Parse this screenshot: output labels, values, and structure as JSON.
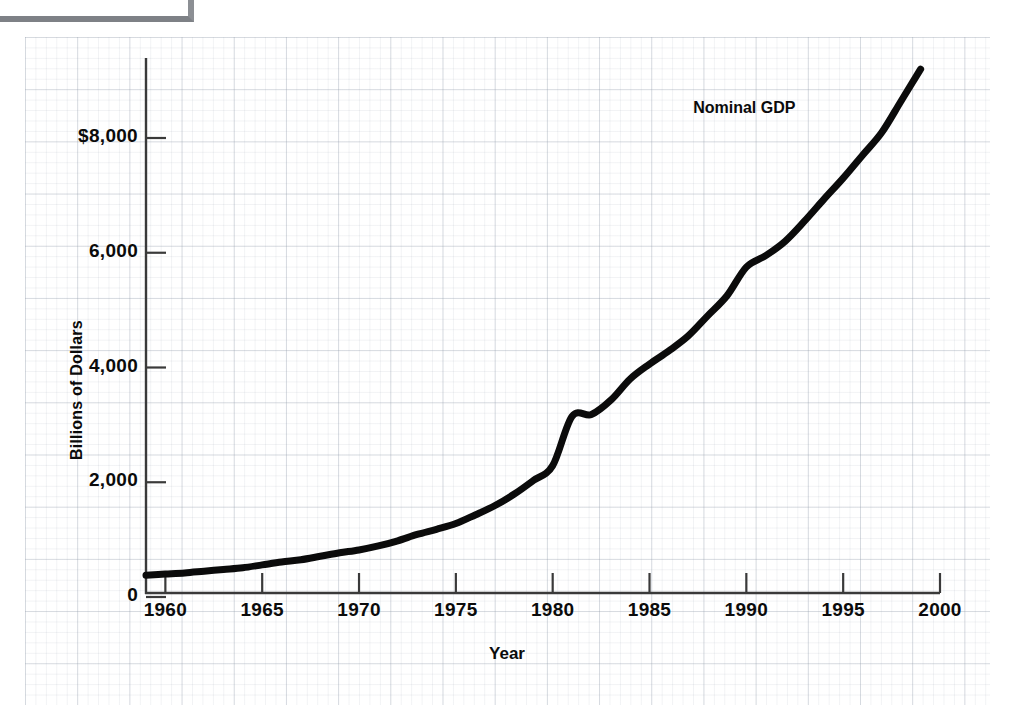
{
  "figure": {
    "background_color": "#ffffff",
    "grid_color": "#96a0af",
    "ink_color": "#0b0b0b"
  },
  "chart_data": {
    "type": "line",
    "title": "",
    "xlabel": "Year",
    "ylabel": "Billions of Dollars",
    "xlim": [
      1959,
      2000
    ],
    "ylim": [
      0,
      9600
    ],
    "xticks": [
      1960,
      1965,
      1970,
      1975,
      1980,
      1985,
      1990,
      1995,
      2000
    ],
    "xtick_labels": [
      "1960",
      "1965",
      "1970",
      "1975",
      "1980",
      "1985",
      "1990",
      "1995",
      "2000"
    ],
    "yticks": [
      0,
      2000,
      4000,
      6000,
      8000
    ],
    "ytick_labels": [
      "0",
      "2,000",
      "4,000",
      "6,000",
      "$8,000"
    ],
    "grid": true,
    "legend_position": "inline-annotation",
    "series": [
      {
        "name": "Nominal GDP",
        "annotation": "Nominal GDP",
        "annotation_at": [
          1995.0,
          8500
        ],
        "color": "#0b0b0b",
        "line_width": 7,
        "x": [
          1959,
          1960,
          1961,
          1962,
          1963,
          1964,
          1965,
          1966,
          1967,
          1968,
          1969,
          1970,
          1971,
          1972,
          1973,
          1974,
          1975,
          1976,
          1977,
          1978,
          1979,
          1980,
          1981,
          1982,
          1983,
          1984,
          1985,
          1986,
          1987,
          1988,
          1989,
          1990,
          1991,
          1992,
          1993,
          1994,
          1995,
          1996,
          1997,
          1998,
          1999
        ],
        "values": [
          380,
          400,
          420,
          450,
          480,
          510,
          560,
          610,
          650,
          710,
          770,
          820,
          890,
          980,
          1090,
          1180,
          1280,
          1430,
          1590,
          1790,
          2030,
          2290,
          3150,
          3180,
          3430,
          3800,
          4060,
          4290,
          4550,
          4900,
          5250,
          5750,
          5950,
          6200,
          6550,
          6930,
          7300,
          7700,
          8100,
          8650,
          9200
        ]
      }
    ]
  },
  "annotations": {
    "series_label": "Nominal GDP"
  },
  "axes": {
    "x_axis_title": "Year",
    "y_axis_title": "Billions of Dollars"
  }
}
